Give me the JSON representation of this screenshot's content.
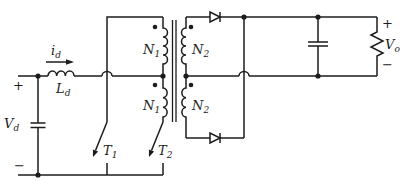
{
  "diagram": {
    "kind": "circuit-schematic",
    "colors": {
      "line": "#1c1c1c",
      "background": "#ffffff"
    },
    "input": {
      "voltage": {
        "base": "V",
        "sub": "d"
      },
      "current": {
        "base": "i",
        "sub": "d"
      },
      "inductor": {
        "base": "L",
        "sub": "d"
      },
      "plus": "+",
      "minus": "−"
    },
    "switches": {
      "t1": {
        "base": "T",
        "sub": "1"
      },
      "t2": {
        "base": "T",
        "sub": "2"
      }
    },
    "transformer": {
      "primary_top": {
        "base": "N",
        "sub": "1"
      },
      "primary_bottom": {
        "base": "N",
        "sub": "1"
      },
      "secondary_top": {
        "base": "N",
        "sub": "2"
      },
      "secondary_bottom": {
        "base": "N",
        "sub": "2"
      }
    },
    "output": {
      "voltage": {
        "base": "V",
        "sub": "o"
      },
      "plus": "+",
      "minus": "−"
    }
  }
}
